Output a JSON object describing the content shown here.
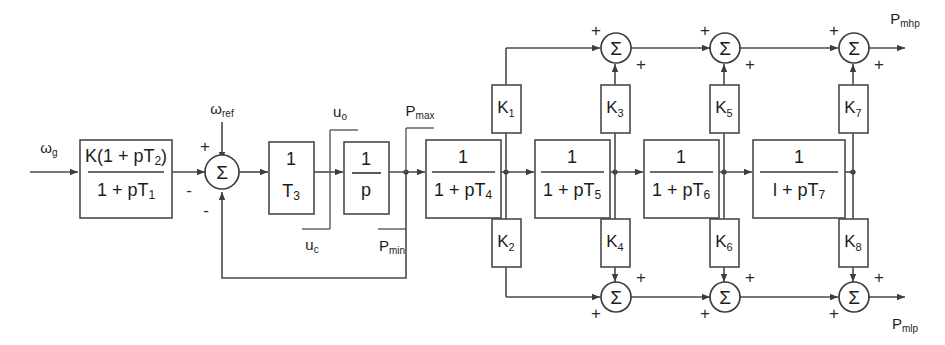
{
  "diagram": {
    "input_label": "ω",
    "input_sub": "g",
    "reference_label": "ω",
    "reference_sub": "ref",
    "lead_lag": {
      "numerator": "K(1 + pT",
      "numerator_sub": "2",
      "numerator_end": ")",
      "denominator": "1 + pT",
      "denominator_sub": "1"
    },
    "summing_signs": {
      "plus": "+",
      "minus": "-",
      "sigma": "Σ"
    },
    "servo": {
      "num": "1",
      "den": "T",
      "den_sub": "3"
    },
    "integrator": {
      "num": "1",
      "den": "p"
    },
    "limiters": [
      {
        "upper": "u",
        "upper_sub": "o",
        "lower": "u",
        "lower_sub": "c"
      },
      {
        "upper": "P",
        "upper_sub": "max",
        "lower": "P",
        "lower_sub": "min"
      }
    ],
    "lag_blocks": [
      {
        "num": "1",
        "den": "1 + pT",
        "den_sub": "4"
      },
      {
        "num": "1",
        "den": "1 +  pT",
        "den_sub": "5"
      },
      {
        "num": "1",
        "den": "1 + pT",
        "den_sub": "6"
      },
      {
        "num": "1",
        "den": "l + pT",
        "den_sub": "7"
      }
    ],
    "gains_top": [
      {
        "label": "K",
        "sub": "1"
      },
      {
        "label": "K",
        "sub": "3"
      },
      {
        "label": "K",
        "sub": "5"
      },
      {
        "label": "K",
        "sub": "7"
      }
    ],
    "gains_bottom": [
      {
        "label": "K",
        "sub": "2"
      },
      {
        "label": "K",
        "sub": "4"
      },
      {
        "label": "K",
        "sub": "6"
      },
      {
        "label": "K",
        "sub": "8"
      }
    ],
    "outputs": [
      {
        "label": "P",
        "sub": "mhp"
      },
      {
        "label": "P",
        "sub": "mlp"
      }
    ],
    "colors": {
      "line": "#4a4a4a",
      "text": "#1c1c1c",
      "background": "#ffffff"
    }
  }
}
